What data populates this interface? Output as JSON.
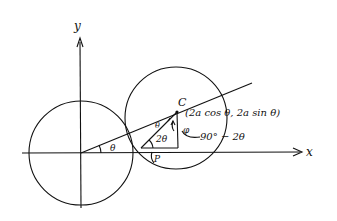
{
  "diagram": {
    "axes": {
      "x_label": "x",
      "y_label": "y"
    },
    "labels": {
      "center_label": "C",
      "coordinates": "(2a cos θ, 2a sin θ)",
      "angle_theta_origin": "θ",
      "angle_theta_at_C": "θ",
      "angle_two_theta": "2θ",
      "angle_phi": "φ",
      "angle_complement": "90° − 2θ",
      "point_P": "P"
    },
    "colors": {
      "ink": "#111111",
      "background": "#ffffff"
    }
  }
}
